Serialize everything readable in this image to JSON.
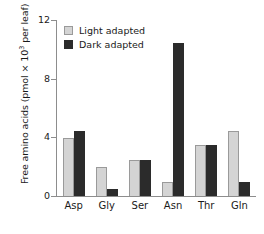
{
  "chart_data": {
    "type": "bar",
    "title": "",
    "xlabel": "",
    "ylabel": "Free amino acids (pmol × 10³ per leaf)",
    "ylabel_prefix": "Free amino acids (pmol × 10",
    "ylabel_exponent": "3",
    "ylabel_suffix": " per leaf)",
    "categories": [
      "Asp",
      "Gly",
      "Ser",
      "Asn",
      "Thr",
      "Gln"
    ],
    "series": [
      {
        "name": "Light adapted",
        "color": "#d4d4d4",
        "values": [
          3.95,
          2.0,
          2.45,
          0.95,
          3.5,
          4.4
        ]
      },
      {
        "name": "Dark adapted",
        "color": "#2b2b2b",
        "values": [
          4.4,
          0.5,
          2.45,
          10.45,
          3.5,
          0.95
        ]
      }
    ],
    "ylim": [
      0,
      12
    ],
    "yticks": [
      0,
      4,
      8,
      12
    ],
    "ytick_labels": [
      "0",
      "4",
      "8",
      "12"
    ],
    "grid": false,
    "legend_position": "top-left"
  },
  "legend": {
    "items": [
      {
        "label": "Light adapted",
        "swatch": "light"
      },
      {
        "label": "Dark adapted",
        "swatch": "dark"
      }
    ]
  }
}
